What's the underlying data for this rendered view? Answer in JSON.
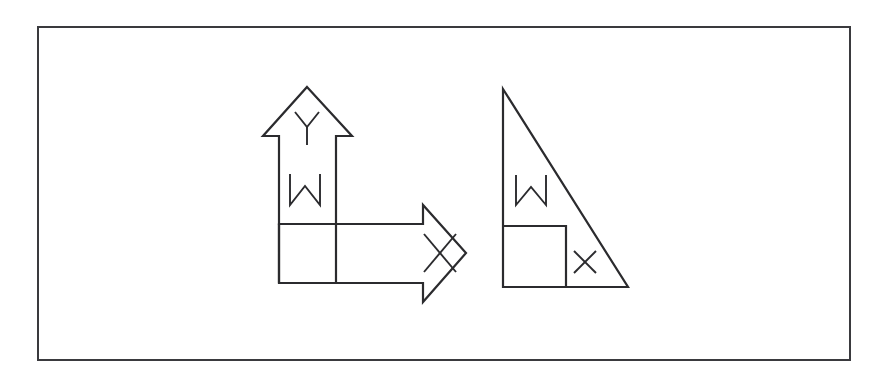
{
  "page": {
    "background_color": "#ffffff",
    "width": 878,
    "height": 384
  },
  "frame": {
    "name": "outer-border-frame",
    "x": 37,
    "y": 26,
    "width": 814,
    "height": 335,
    "stroke_color": "#3a3a3e",
    "stroke_width": 2,
    "fill": "#ffffff"
  },
  "diagram": {
    "title": "",
    "line_color": "#2b2b2e",
    "figure_count": 2,
    "figures": [
      {
        "id": "left-figure",
        "name": "arrow-cross-figure",
        "description": "An up-pointing arrow and a right-pointing arrow joined at a shared square corner",
        "parts": [
          {
            "id": "up-arrow",
            "name": "up-arrow-shape",
            "direction": "up",
            "apex": [
              307,
              87
            ],
            "head_base_y": 136,
            "head_left_x": 263,
            "head_right_x": 352,
            "shaft_left_x": 279,
            "shaft_right_x": 336,
            "shaft_bottom_y": 224
          },
          {
            "id": "right-arrow",
            "name": "right-arrow-shape",
            "direction": "right",
            "tip": [
              466,
              253
            ],
            "head_notch_x": 423,
            "head_top_y": 205,
            "head_bottom_y": 302,
            "body_top_y": 224,
            "body_bottom_y": 283,
            "body_left_x": 279
          },
          {
            "id": "corner-square",
            "name": "corner-unit-square",
            "x": 279,
            "y": 224,
            "width": 57,
            "height": 59
          }
        ],
        "labels": [
          {
            "id": "left-y",
            "name": "label-y-arrowhead",
            "text": "Y",
            "x": 307,
            "y": 125,
            "font_size": 26
          },
          {
            "id": "left-w",
            "name": "label-w-shaft",
            "text": "W",
            "x": 305,
            "y": 190,
            "font_size": 30
          },
          {
            "id": "left-x",
            "name": "label-x-arrowhead",
            "text": "X",
            "x": 440,
            "y": 253,
            "font_size": 28
          }
        ]
      },
      {
        "id": "right-figure",
        "name": "right-triangle-figure",
        "description": "A right triangle with the right angle at the bottom left and an inscribed square in that corner",
        "parts": [
          {
            "id": "triangle",
            "name": "right-triangle-shape",
            "apex": [
              503,
              89
            ],
            "right_angle_vertex": [
              503,
              287
            ],
            "base_right_vertex": [
              628,
              287
            ],
            "leg_vertical_length": 198,
            "leg_horizontal_length": 125
          },
          {
            "id": "inner-square",
            "name": "inscribed-unit-square",
            "x": 503,
            "y": 226,
            "width": 63,
            "height": 61
          }
        ],
        "labels": [
          {
            "id": "right-w",
            "name": "label-w-triangle",
            "text": "W",
            "x": 531,
            "y": 190,
            "font_size": 30
          },
          {
            "id": "right-x",
            "name": "label-x-lower-right",
            "text": "x",
            "x": 585,
            "y": 262,
            "font_size": 22
          }
        ]
      }
    ],
    "letters_used": [
      "Y",
      "W",
      "X",
      "x"
    ]
  }
}
